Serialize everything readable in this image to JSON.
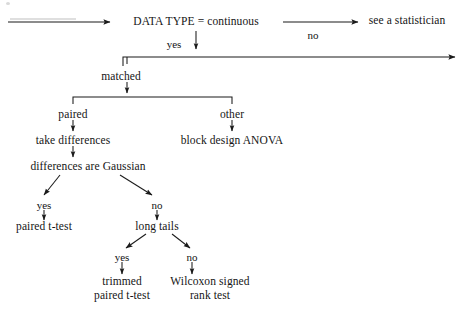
{
  "diagram": {
    "type": "flowchart",
    "background_color": "#ffffff",
    "ink_color": "#151515",
    "nodes": [
      {
        "id": "data-type",
        "text": "DATA TYPE = continuous",
        "x": 196,
        "y": 22
      },
      {
        "id": "see-a-statistician",
        "text": "see a statistician",
        "x": 407,
        "y": 21
      },
      {
        "id": "matched",
        "text": "matched",
        "x": 121,
        "y": 77
      },
      {
        "id": "paired",
        "text": "paired",
        "x": 73,
        "y": 115
      },
      {
        "id": "other",
        "text": "other",
        "x": 232,
        "y": 115
      },
      {
        "id": "take-differences",
        "text": "take differences",
        "x": 73,
        "y": 141
      },
      {
        "id": "block-design-anova",
        "text": "block design ANOVA",
        "x": 232,
        "y": 141
      },
      {
        "id": "differences-gaussian",
        "text": "differences are Gaussian",
        "x": 88,
        "y": 167
      },
      {
        "id": "paired-t-test",
        "text": "paired t-test",
        "x": 44,
        "y": 227
      },
      {
        "id": "long-tails",
        "text": "long tails",
        "x": 157,
        "y": 227
      },
      {
        "id": "trimmed-paired-t-test",
        "text_line1": "trimmed",
        "text_line2": "paired t-test",
        "x": 122,
        "y": 288
      },
      {
        "id": "wilcoxon-signed-rank",
        "text_line1": "Wilcoxon signed",
        "text_line2": "rank test",
        "x": 210,
        "y": 288
      }
    ],
    "edge_labels": [
      {
        "id": "yes-continuous",
        "text": "yes",
        "x": 174,
        "y": 44
      },
      {
        "id": "no-continuous",
        "text": "no",
        "x": 313,
        "y": 35
      },
      {
        "id": "yes-gaussian",
        "text": "yes",
        "x": 44,
        "y": 205
      },
      {
        "id": "no-gaussian",
        "text": "no",
        "x": 157,
        "y": 205
      },
      {
        "id": "yes-long-tails",
        "text": "yes",
        "x": 122,
        "y": 257
      },
      {
        "id": "no-long-tails",
        "text": "no",
        "x": 192,
        "y": 257
      }
    ]
  }
}
